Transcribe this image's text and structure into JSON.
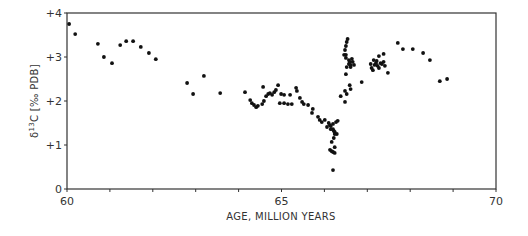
{
  "chart_data": {
    "type": "scatter",
    "title": "",
    "xlabel": "AGE, MILLION YEARS",
    "ylabel": "δ13C [‰ PDB]",
    "ylabel_parts": {
      "delta": "δ",
      "sup": "13",
      "rest": "C [‰ PDB]"
    },
    "xlim": [
      60,
      70
    ],
    "ylim": [
      0,
      4
    ],
    "x_ticks": [
      60,
      61,
      62,
      63,
      64,
      65,
      66,
      67,
      68,
      69,
      70
    ],
    "x_tick_labels": [
      {
        "value": 60,
        "label": "60"
      },
      {
        "value": 65,
        "label": "65"
      },
      {
        "value": 70,
        "label": "70"
      }
    ],
    "y_tick_labels": [
      {
        "value": 0,
        "label": "0"
      },
      {
        "value": 1,
        "label": "+1"
      },
      {
        "value": 2,
        "label": "+2"
      },
      {
        "value": 3,
        "label": "+3"
      },
      {
        "value": 4,
        "label": "+4"
      }
    ],
    "grid": false,
    "legend": null,
    "marker_color": "#111111",
    "axis_color": "#333333",
    "points": [
      [
        60.05,
        3.75
      ],
      [
        60.19,
        3.52
      ],
      [
        60.72,
        3.3
      ],
      [
        60.86,
        3.0
      ],
      [
        61.05,
        2.86
      ],
      [
        61.24,
        3.27
      ],
      [
        61.38,
        3.36
      ],
      [
        61.54,
        3.36
      ],
      [
        61.72,
        3.23
      ],
      [
        61.91,
        3.09
      ],
      [
        62.07,
        2.95
      ],
      [
        62.8,
        2.41
      ],
      [
        62.94,
        2.16
      ],
      [
        63.19,
        2.57
      ],
      [
        63.57,
        2.18
      ],
      [
        64.15,
        2.2
      ],
      [
        64.27,
        2.02
      ],
      [
        64.31,
        1.95
      ],
      [
        64.36,
        1.91
      ],
      [
        64.41,
        1.86
      ],
      [
        64.45,
        1.89
      ],
      [
        64.55,
        1.93
      ],
      [
        64.59,
        2.0
      ],
      [
        64.57,
        2.32
      ],
      [
        64.64,
        2.11
      ],
      [
        64.69,
        2.16
      ],
      [
        64.73,
        2.18
      ],
      [
        64.78,
        2.14
      ],
      [
        64.83,
        2.2
      ],
      [
        64.87,
        2.25
      ],
      [
        64.92,
        2.36
      ],
      [
        64.99,
        2.16
      ],
      [
        65.06,
        2.14
      ],
      [
        64.96,
        1.95
      ],
      [
        65.06,
        1.95
      ],
      [
        65.2,
        2.14
      ],
      [
        65.15,
        1.93
      ],
      [
        65.24,
        1.93
      ],
      [
        65.34,
        2.3
      ],
      [
        65.36,
        2.23
      ],
      [
        65.43,
        2.07
      ],
      [
        65.48,
        1.98
      ],
      [
        65.52,
        1.93
      ],
      [
        65.62,
        1.91
      ],
      [
        65.73,
        1.82
      ],
      [
        65.85,
        1.64
      ],
      [
        65.89,
        1.57
      ],
      [
        65.71,
        1.73
      ],
      [
        65.94,
        1.52
      ],
      [
        66.01,
        1.57
      ],
      [
        66.13,
        1.45
      ],
      [
        66.06,
        1.41
      ],
      [
        66.15,
        1.36
      ],
      [
        66.2,
        1.48
      ],
      [
        66.27,
        1.52
      ],
      [
        66.22,
        1.32
      ],
      [
        66.1,
        1.5
      ],
      [
        66.15,
        1.43
      ],
      [
        66.2,
        1.36
      ],
      [
        66.24,
        1.3
      ],
      [
        66.24,
        1.25
      ],
      [
        66.22,
        1.16
      ],
      [
        66.17,
        1.07
      ],
      [
        66.24,
        0.95
      ],
      [
        66.13,
        0.89
      ],
      [
        66.17,
        0.86
      ],
      [
        66.2,
        0.84
      ],
      [
        66.24,
        0.82
      ],
      [
        66.2,
        0.43
      ],
      [
        66.29,
        1.25
      ],
      [
        66.31,
        1.55
      ],
      [
        66.48,
        1.98
      ],
      [
        66.52,
        2.16
      ],
      [
        66.38,
        2.11
      ],
      [
        66.48,
        2.23
      ],
      [
        66.59,
        2.36
      ],
      [
        66.5,
        2.61
      ],
      [
        66.61,
        2.27
      ],
      [
        66.52,
        2.77
      ],
      [
        66.57,
        2.84
      ],
      [
        66.61,
        2.82
      ],
      [
        66.5,
        2.98
      ],
      [
        66.59,
        2.89
      ],
      [
        66.5,
        3.05
      ],
      [
        66.48,
        3.16
      ],
      [
        66.46,
        3.05
      ],
      [
        66.5,
        3.25
      ],
      [
        66.52,
        3.34
      ],
      [
        66.54,
        3.41
      ],
      [
        66.57,
        2.93
      ],
      [
        66.61,
        2.77
      ],
      [
        66.66,
        2.89
      ],
      [
        66.64,
        2.96
      ],
      [
        66.69,
        2.82
      ],
      [
        66.87,
        2.43
      ],
      [
        67.08,
        2.84
      ],
      [
        67.1,
        2.75
      ],
      [
        67.13,
        2.7
      ],
      [
        67.15,
        2.93
      ],
      [
        67.17,
        2.82
      ],
      [
        67.2,
        2.86
      ],
      [
        67.22,
        2.91
      ],
      [
        67.24,
        2.8
      ],
      [
        67.27,
        2.75
      ],
      [
        67.31,
        2.86
      ],
      [
        67.34,
        2.84
      ],
      [
        67.38,
        2.89
      ],
      [
        67.41,
        2.8
      ],
      [
        67.27,
        3.02
      ],
      [
        67.38,
        3.07
      ],
      [
        67.48,
        2.64
      ],
      [
        67.71,
        3.32
      ],
      [
        67.83,
        3.18
      ],
      [
        68.06,
        3.18
      ],
      [
        68.3,
        3.09
      ],
      [
        68.46,
        2.93
      ],
      [
        68.69,
        2.45
      ],
      [
        68.86,
        2.5
      ]
    ]
  }
}
